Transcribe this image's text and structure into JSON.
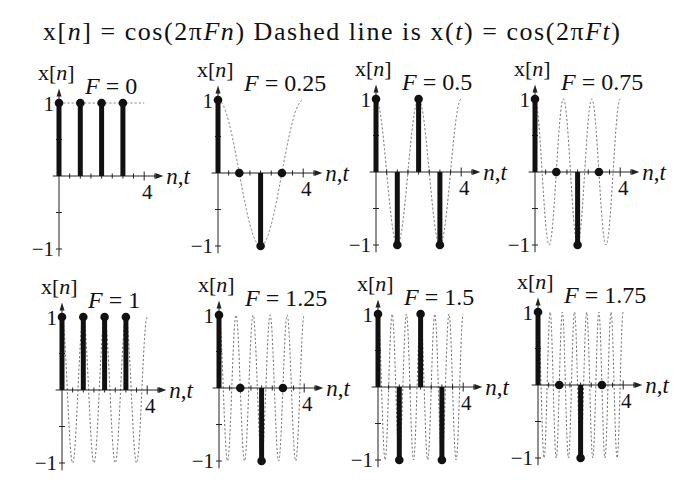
{
  "figure": {
    "title": "x[n] = cos(2πFn) Dashed line is x(t) = cos(2πFt)",
    "title_segments": [
      {
        "text": "x[",
        "italic": false
      },
      {
        "text": "n",
        "italic": true
      },
      {
        "text": "] = cos(2π",
        "italic": false
      },
      {
        "text": "Fn",
        "italic": true
      },
      {
        "text": ") Dashed line is x(",
        "italic": false
      },
      {
        "text": "t",
        "italic": true
      },
      {
        "text": ") = cos(2π",
        "italic": false
      },
      {
        "text": "Ft",
        "italic": true
      },
      {
        "text": ")",
        "italic": false
      }
    ],
    "colors": {
      "stem": "#111111",
      "dashed": "#6e6e6e",
      "axis": "#222222",
      "text": "#111111"
    }
  },
  "chart_data": [
    {
      "type": "line",
      "title": "F = 0",
      "F": 0,
      "xlabel": "n,t",
      "ylabel": "x[n]",
      "xlim": [
        0,
        4
      ],
      "ylim": [
        -1,
        1
      ],
      "grid": false,
      "minor_tick_step": 0.5,
      "x_tick_labels": [
        {
          "value": 4,
          "label": "4"
        }
      ],
      "y_tick_labels": [
        {
          "value": 1,
          "label": "1"
        },
        {
          "value": -1,
          "label": "−1"
        }
      ],
      "series": [
        {
          "name": "x[n] = cos(2πFn)",
          "style": "stem",
          "n": [
            0,
            1,
            2,
            3
          ],
          "values": [
            1,
            1,
            1,
            1
          ]
        },
        {
          "name": "x(t) = cos(2πFt)",
          "style": "dashed",
          "t_range": [
            0,
            4
          ]
        }
      ]
    },
    {
      "type": "line",
      "title": "F = 0.25",
      "F": 0.25,
      "xlabel": "n,t",
      "ylabel": "x[n]",
      "xlim": [
        0,
        4
      ],
      "ylim": [
        -1,
        1
      ],
      "grid": false,
      "minor_tick_step": 0.5,
      "x_tick_labels": [
        {
          "value": 4,
          "label": "4"
        }
      ],
      "y_tick_labels": [
        {
          "value": 1,
          "label": "1"
        },
        {
          "value": -1,
          "label": "−1"
        }
      ],
      "series": [
        {
          "name": "x[n] = cos(2πFn)",
          "style": "stem",
          "n": [
            0,
            1,
            2,
            3
          ],
          "values": [
            1,
            0,
            -1,
            0
          ]
        },
        {
          "name": "x(t) = cos(2πFt)",
          "style": "dashed",
          "t_range": [
            0,
            4
          ]
        }
      ]
    },
    {
      "type": "line",
      "title": "F = 0.5",
      "F": 0.5,
      "xlabel": "n,t",
      "ylabel": "x[n]",
      "xlim": [
        0,
        4
      ],
      "ylim": [
        -1,
        1
      ],
      "grid": false,
      "minor_tick_step": 0.5,
      "x_tick_labels": [
        {
          "value": 4,
          "label": "4"
        }
      ],
      "y_tick_labels": [
        {
          "value": 1,
          "label": "1"
        },
        {
          "value": -1,
          "label": "−1"
        }
      ],
      "series": [
        {
          "name": "x[n] = cos(2πFn)",
          "style": "stem",
          "n": [
            0,
            1,
            2,
            3
          ],
          "values": [
            1,
            -1,
            1,
            -1
          ]
        },
        {
          "name": "x(t) = cos(2πFt)",
          "style": "dashed",
          "t_range": [
            0,
            4
          ]
        }
      ]
    },
    {
      "type": "line",
      "title": "F = 0.75",
      "F": 0.75,
      "xlabel": "n,t",
      "ylabel": "x[n]",
      "xlim": [
        0,
        4
      ],
      "ylim": [
        -1,
        1
      ],
      "grid": false,
      "minor_tick_step": 0.5,
      "x_tick_labels": [
        {
          "value": 4,
          "label": "4"
        }
      ],
      "y_tick_labels": [
        {
          "value": 1,
          "label": "1"
        },
        {
          "value": -1,
          "label": "−1"
        }
      ],
      "series": [
        {
          "name": "x[n] = cos(2πFn)",
          "style": "stem",
          "n": [
            0,
            1,
            2,
            3
          ],
          "values": [
            1,
            0,
            -1,
            0
          ]
        },
        {
          "name": "x(t) = cos(2πFt)",
          "style": "dashed",
          "t_range": [
            0,
            4
          ]
        }
      ]
    },
    {
      "type": "line",
      "title": "F = 1",
      "F": 1,
      "xlabel": "n,t",
      "ylabel": "x[n]",
      "xlim": [
        0,
        4
      ],
      "ylim": [
        -1,
        1
      ],
      "grid": false,
      "minor_tick_step": 0.5,
      "x_tick_labels": [
        {
          "value": 4,
          "label": "4"
        }
      ],
      "y_tick_labels": [
        {
          "value": 1,
          "label": "1"
        },
        {
          "value": -1,
          "label": "−1"
        }
      ],
      "series": [
        {
          "name": "x[n] = cos(2πFn)",
          "style": "stem",
          "n": [
            0,
            1,
            2,
            3
          ],
          "values": [
            1,
            1,
            1,
            1
          ]
        },
        {
          "name": "x(t) = cos(2πFt)",
          "style": "dashed",
          "t_range": [
            0,
            4
          ]
        }
      ]
    },
    {
      "type": "line",
      "title": "F = 1.25",
      "F": 1.25,
      "xlabel": "n,t",
      "ylabel": "x[n]",
      "xlim": [
        0,
        4
      ],
      "ylim": [
        -1,
        1
      ],
      "grid": false,
      "minor_tick_step": 0.5,
      "x_tick_labels": [
        {
          "value": 4,
          "label": "4"
        }
      ],
      "y_tick_labels": [
        {
          "value": 1,
          "label": "1"
        },
        {
          "value": -1,
          "label": "−1"
        }
      ],
      "series": [
        {
          "name": "x[n] = cos(2πFn)",
          "style": "stem",
          "n": [
            0,
            1,
            2,
            3
          ],
          "values": [
            1,
            0,
            -1,
            0
          ]
        },
        {
          "name": "x(t) = cos(2πFt)",
          "style": "dashed",
          "t_range": [
            0,
            4
          ]
        }
      ]
    },
    {
      "type": "line",
      "title": "F = 1.5",
      "F": 1.5,
      "xlabel": "n,t",
      "ylabel": "x[n]",
      "xlim": [
        0,
        4
      ],
      "ylim": [
        -1,
        1
      ],
      "grid": false,
      "minor_tick_step": 0.5,
      "x_tick_labels": [
        {
          "value": 4,
          "label": "4"
        }
      ],
      "y_tick_labels": [
        {
          "value": 1,
          "label": "1"
        },
        {
          "value": -1,
          "label": "−1"
        }
      ],
      "series": [
        {
          "name": "x[n] = cos(2πFn)",
          "style": "stem",
          "n": [
            0,
            1,
            2,
            3
          ],
          "values": [
            1,
            -1,
            1,
            -1
          ]
        },
        {
          "name": "x(t) = cos(2πFt)",
          "style": "dashed",
          "t_range": [
            0,
            4
          ]
        }
      ]
    },
    {
      "type": "line",
      "title": "F = 1.75",
      "F": 1.75,
      "xlabel": "n,t",
      "ylabel": "x[n]",
      "xlim": [
        0,
        4
      ],
      "ylim": [
        -1,
        1
      ],
      "grid": false,
      "minor_tick_step": 0.5,
      "x_tick_labels": [
        {
          "value": 4,
          "label": "4"
        }
      ],
      "y_tick_labels": [
        {
          "value": 1,
          "label": "1"
        },
        {
          "value": -1,
          "label": "−1"
        }
      ],
      "series": [
        {
          "name": "x[n] = cos(2πFn)",
          "style": "stem",
          "n": [
            0,
            1,
            2,
            3
          ],
          "values": [
            1,
            0,
            -1,
            0
          ]
        },
        {
          "name": "x(t) = cos(2πFt)",
          "style": "dashed",
          "t_range": [
            0,
            4
          ]
        }
      ]
    }
  ]
}
